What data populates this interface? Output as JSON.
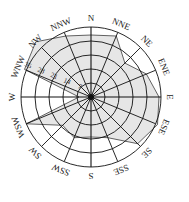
{
  "chart_data": {
    "type": "radar",
    "subtype": "wind-rose",
    "title": "",
    "directions": [
      "N",
      "NNE",
      "NE",
      "ENE",
      "E",
      "ESE",
      "SE",
      "SSE",
      "S",
      "SSW",
      "SW",
      "WSW",
      "W",
      "WNW",
      "NW",
      "NNW"
    ],
    "values": [
      31,
      33,
      24,
      30,
      34,
      36,
      33,
      22,
      20,
      22,
      20,
      35,
      6,
      36,
      39,
      33
    ],
    "radial_ticks": [
      7,
      14,
      21,
      28,
      35
    ],
    "radial_max": 35,
    "radial_label_direction": "WNW",
    "grid": true,
    "legend": null,
    "colors": {
      "fill": "#e6e6e6",
      "line": "#222222",
      "grid": "#111111"
    }
  }
}
